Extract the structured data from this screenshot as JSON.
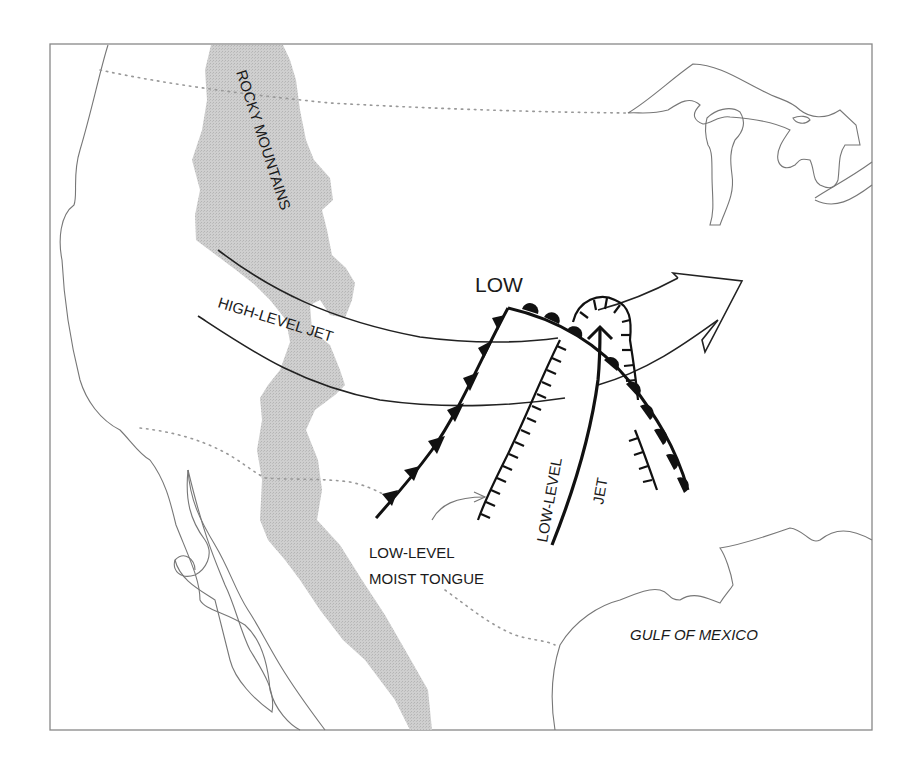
{
  "figure": {
    "type": "schematic weather map",
    "region": "continental United States and northern Mexico",
    "frame": {
      "stroke": "#888888",
      "background": "#ffffff"
    }
  },
  "labels": {
    "mountains": "ROCKY MOUNTAINS",
    "low_center": "LOW",
    "high_level_jet": "HIGH-LEVEL JET",
    "low_level_jet_1": "LOW-LEVEL",
    "low_level_jet_2": "JET",
    "moist_tongue_1": "LOW-LEVEL",
    "moist_tongue_2": "MOIST TONGUE",
    "gulf": "GULF OF MEXICO"
  },
  "features": [
    {
      "name": "Rocky Mountains",
      "symbol": "gray stippled band",
      "color": "#c8c8c8"
    },
    {
      "name": "High-level jet",
      "symbol": "curved double line (channel)"
    },
    {
      "name": "Cold front",
      "symbol": "line with filled triangles"
    },
    {
      "name": "Warm front",
      "symbol": "line with filled semicircles"
    },
    {
      "name": "Dry line / moisture boundary",
      "symbol": "line with hatch ticks"
    },
    {
      "name": "Low-level jet",
      "symbol": "thick curved arrow"
    },
    {
      "name": "Outflow / flow arrow",
      "symbol": "large open arrow toward northeast"
    },
    {
      "name": "Low-level moist tongue",
      "symbol": "thin gray arrow pointing at dry line"
    }
  ],
  "colors": {
    "ink": "#111111",
    "coastline": "#777777",
    "political_border": "#999999",
    "mountains": "#c8c8c8"
  }
}
